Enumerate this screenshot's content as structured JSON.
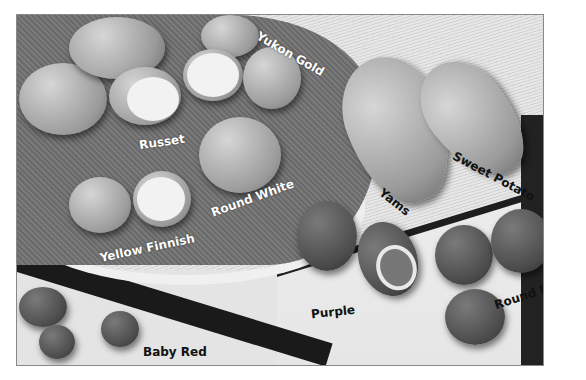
{
  "image": {
    "description": "Grayscale photograph of potato varieties arranged on a cloth-lined basket and a tray, each variety labeled",
    "labels": {
      "yukon_gold": "Yukon Gold",
      "russet": "Russet",
      "round_white": "Round White",
      "yellow_finnish": "Yellow Finnish",
      "yams": "Yams",
      "sweet_potato": "Sweet Potato",
      "purple": "Purple",
      "round_red": "Round Red",
      "baby_red": "Baby Red"
    }
  }
}
